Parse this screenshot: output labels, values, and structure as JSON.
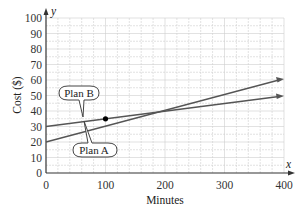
{
  "chart_data": {
    "type": "line",
    "title": "",
    "xlabel": "Minutes",
    "ylabel": "Cost ($)",
    "x_axis_var": "x",
    "y_axis_var": "y",
    "xlim": [
      0,
      400
    ],
    "ylim": [
      0,
      100
    ],
    "xticks": [
      0,
      100,
      200,
      300,
      400
    ],
    "yticks": [
      0,
      10,
      20,
      30,
      40,
      50,
      60,
      70,
      80,
      90,
      100
    ],
    "grid": true,
    "series": [
      {
        "name": "Plan A",
        "x": [
          0,
          400
        ],
        "values": [
          20,
          80
        ],
        "slope": 0.15,
        "intercept": 20
      },
      {
        "name": "Plan B",
        "x": [
          0,
          400
        ],
        "values": [
          30,
          50
        ],
        "slope": 0.05,
        "intercept": 30
      }
    ],
    "annotations": [
      {
        "type": "point",
        "x": 100,
        "y": 35,
        "label": "intersection"
      },
      {
        "type": "callout",
        "text": "Plan B"
      },
      {
        "type": "callout",
        "text": "Plan A"
      }
    ]
  },
  "labels": {
    "xlabel": "Minutes",
    "ylabel": "Cost ($)",
    "xvar": "x",
    "yvar": "y",
    "planA": "Plan A",
    "planB": "Plan B",
    "xt0": "0",
    "xt1": "100",
    "xt2": "200",
    "xt3": "300",
    "xt4": "400",
    "yt0": "0",
    "yt1": "10",
    "yt2": "20",
    "yt3": "30",
    "yt4": "40",
    "yt5": "50",
    "yt6": "60",
    "yt7": "70",
    "yt8": "80",
    "yt9": "90",
    "yt10": "100"
  },
  "colors": {
    "line": "#555555",
    "grid": "#c8c8c8",
    "point": "#000000"
  }
}
